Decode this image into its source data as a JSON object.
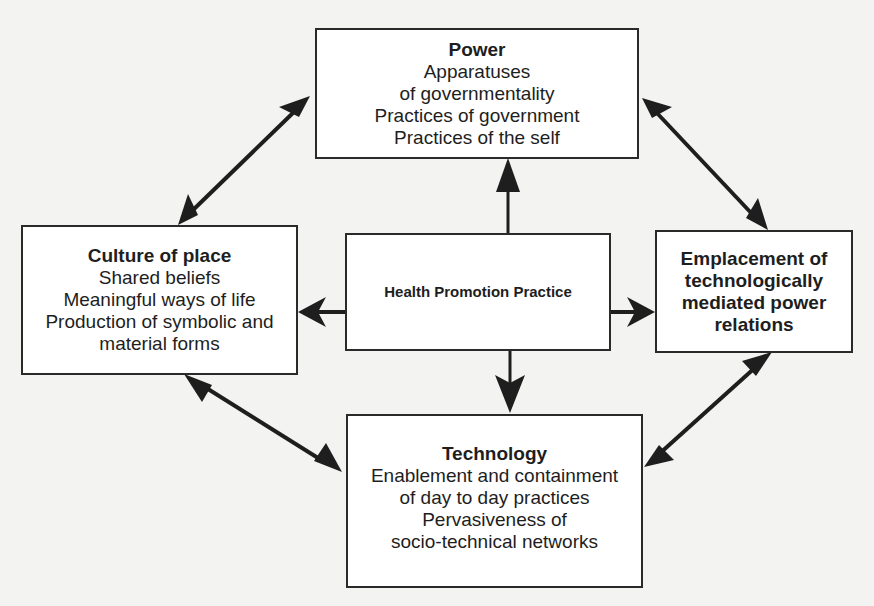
{
  "diagram": {
    "nodes": {
      "power": {
        "title": "Power",
        "lines": [
          "Apparatuses",
          "of governmentality",
          "Practices of government",
          "Practices of the self"
        ]
      },
      "culture": {
        "title": "Culture of place",
        "lines": [
          "Shared beliefs",
          "Meaningful ways of life",
          "Production of symbolic and",
          "material forms"
        ]
      },
      "center": {
        "title": "Health Promotion Practice"
      },
      "emplacement": {
        "title_lines": [
          "Emplacement of",
          "technologically",
          "mediated power",
          "relations"
        ]
      },
      "technology": {
        "title": "Technology",
        "lines": [
          "Enablement and containment",
          "of day to day practices",
          "Pervasiveness of",
          "socio-technical networks"
        ]
      }
    },
    "edges": [
      {
        "from": "culture",
        "to": "power",
        "type": "bidirectional"
      },
      {
        "from": "power",
        "to": "emplacement",
        "type": "bidirectional"
      },
      {
        "from": "culture",
        "to": "technology",
        "type": "bidirectional"
      },
      {
        "from": "emplacement",
        "to": "technology",
        "type": "bidirectional"
      },
      {
        "from": "center",
        "to": "power",
        "type": "directed"
      },
      {
        "from": "center",
        "to": "culture",
        "type": "directed"
      },
      {
        "from": "center",
        "to": "emplacement",
        "type": "directed"
      },
      {
        "from": "center",
        "to": "technology",
        "type": "directed"
      }
    ],
    "colors": {
      "stroke": "#1e1e1e",
      "background": "#f3f3f1",
      "box_fill": "#ffffff"
    }
  }
}
